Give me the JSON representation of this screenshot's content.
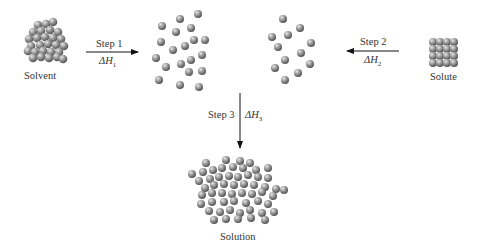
{
  "labels": {
    "solvent": "Solvent",
    "solute": "Solute",
    "solution": "Solution"
  },
  "steps": [
    {
      "label": "Step 1",
      "delta": "ΔH",
      "sub": "1",
      "direction": "right"
    },
    {
      "label": "Step 2",
      "delta": "ΔH",
      "sub": "2",
      "direction": "left"
    },
    {
      "label": "Step 3",
      "delta": "ΔH",
      "sub": "3",
      "direction": "down"
    }
  ],
  "colors": {
    "sphere_light": "#d8d8d8",
    "sphere_mid": "#8a8a8a",
    "sphere_dark": "#4a4a4a",
    "arrow": "#111111"
  }
}
